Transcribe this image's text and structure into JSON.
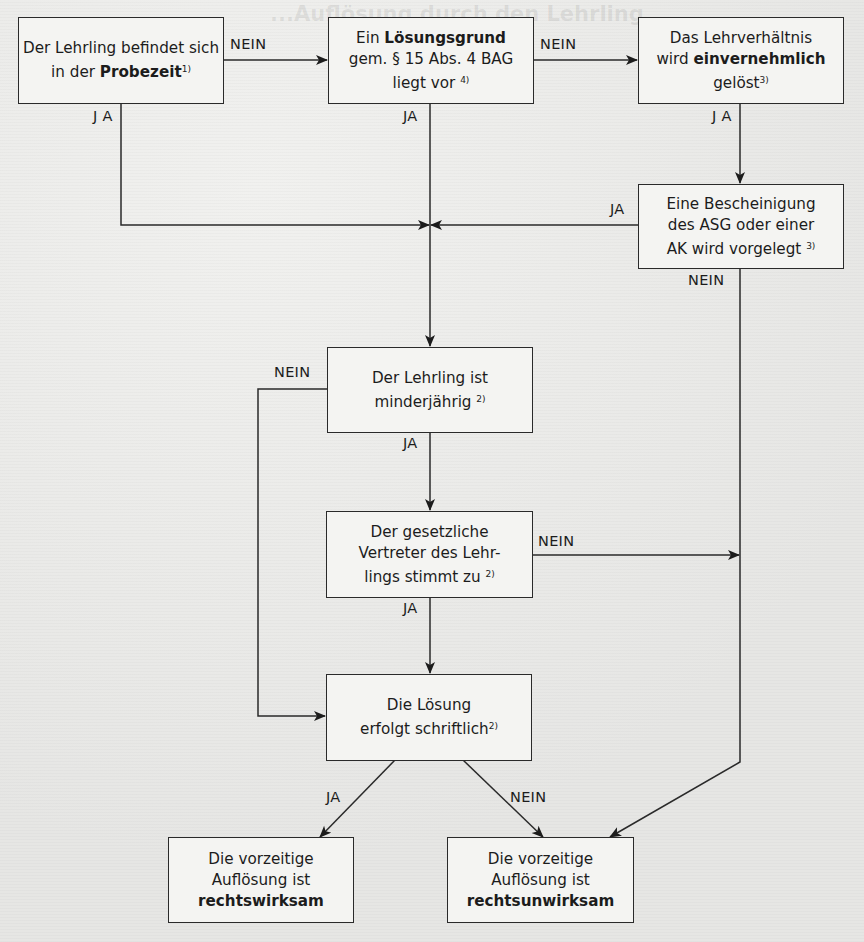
{
  "diagram": {
    "background_text_heading": "...Auflösung durch den Lehrling",
    "colors": {
      "line": "#2a2a2a",
      "box_fill": "#f4f4f2",
      "paper": "#e9e9e7"
    },
    "nodes": {
      "probezeit": {
        "pre": "Der Lehrling befindet sich in der ",
        "bold": "Probezeit",
        "sup": "1)",
        "post": ""
      },
      "loesungsgrund": {
        "pre": "Ein ",
        "bold": "Lösungsgrund",
        "line2": "gem. § 15 Abs. 4 BAG",
        "line3": "liegt vor",
        "sup": "4)"
      },
      "einvernehmlich": {
        "line1": "Das Lehrverhältnis",
        "pre": "wird ",
        "bold": "einvernehmlich",
        "line3": "gelöst",
        "sup": "3)"
      },
      "bescheinigung": {
        "line1": "Eine Bescheinigung",
        "line2": "des ASG oder einer",
        "line3": "AK wird vorgelegt",
        "sup": "3)"
      },
      "minderjaehrig": {
        "line1": "Der Lehrling ist",
        "line2": "minderjährig",
        "sup": "2)"
      },
      "vertreter": {
        "line1": "Der gesetzliche",
        "line2": "Vertreter des Lehr-",
        "line3": "lings stimmt zu",
        "sup": "2)"
      },
      "schriftlich": {
        "line1": "Die Lösung",
        "line2": "erfolgt schriftlich",
        "sup": "2)"
      },
      "wirksam": {
        "line1": "Die vorzeitige",
        "line2": "Auflösung ist",
        "bold": "rechtswirksam"
      },
      "unwirksam": {
        "line1": "Die vorzeitige",
        "line2": "Auflösung ist",
        "bold": "rechtsunwirksam"
      }
    },
    "edge_labels": {
      "probezeit_nein": "NEIN",
      "probezeit_ja": "J A",
      "loesungsgrund_nein": "NEIN",
      "loesungsgrund_ja": "JA",
      "einvernehmlich_ja": "J A",
      "bescheinigung_ja": "JA",
      "bescheinigung_nein": "NEIN",
      "minderjaehrig_nein": "NEIN",
      "minderjaehrig_ja": "JA",
      "vertreter_nein": "NEIN",
      "vertreter_ja": "JA",
      "schriftlich_ja": "JA",
      "schriftlich_nein": "NEIN"
    }
  }
}
